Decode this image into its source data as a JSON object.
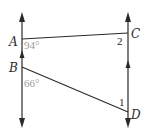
{
  "diagram": {
    "type": "geometry",
    "colors": {
      "line": "#2a2a2a",
      "angle_label": "#9a9a9a",
      "background": "#ffffff"
    },
    "points": {
      "A": {
        "label": "A",
        "x": 22,
        "y": 39
      },
      "B": {
        "label": "B",
        "x": 22,
        "y": 67
      },
      "C": {
        "label": "C",
        "x": 128,
        "y": 33
      },
      "D": {
        "label": "D",
        "x": 128,
        "y": 112
      }
    },
    "angles": {
      "at_A": {
        "label": "94°",
        "value": 94
      },
      "at_B": {
        "label": "66°",
        "value": 66
      },
      "angle_1": {
        "label": "1"
      },
      "angle_2": {
        "label": "2"
      }
    },
    "lines": [
      {
        "name": "left-parallel-line",
        "through": "A,B",
        "arrows": "both",
        "parallel_marker": true
      },
      {
        "name": "right-parallel-line",
        "through": "C,D",
        "arrows": "both",
        "parallel_marker": true
      },
      {
        "name": "transversal-AC",
        "from": "A",
        "to": "C"
      },
      {
        "name": "transversal-BD",
        "from": "B",
        "to": "D"
      }
    ]
  }
}
